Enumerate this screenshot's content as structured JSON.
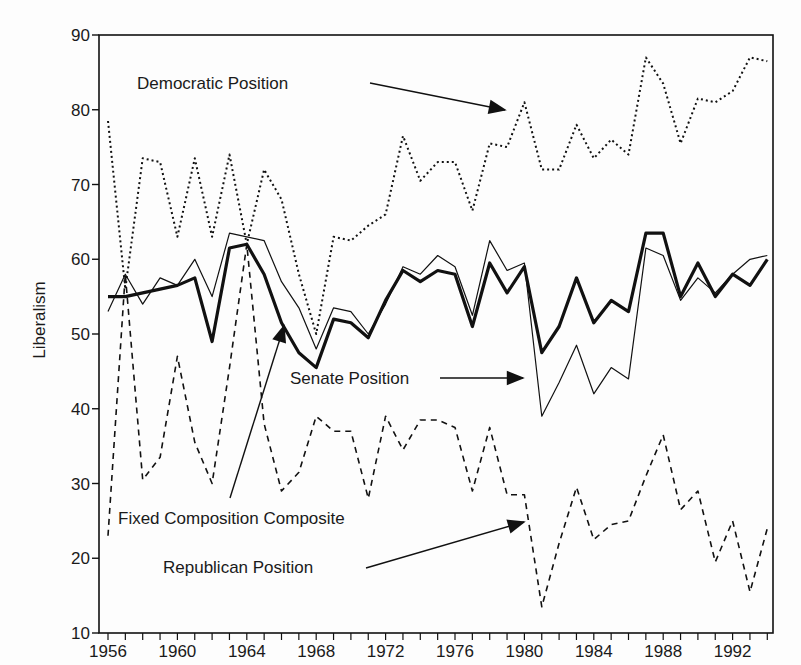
{
  "chart_data": {
    "type": "line",
    "title": "",
    "xlabel": "",
    "ylabel": "Liberalism",
    "xlim": [
      1956,
      1994
    ],
    "ylim": [
      10,
      90
    ],
    "yticks": [
      10,
      20,
      30,
      40,
      50,
      60,
      70,
      80,
      90
    ],
    "xtick_labels": [
      "1956",
      "1960",
      "1964",
      "1968",
      "1972",
      "1976",
      "1980",
      "1984",
      "1988",
      "1992"
    ],
    "grid": false,
    "x": [
      1956,
      1957,
      1958,
      1959,
      1960,
      1961,
      1962,
      1963,
      1964,
      1965,
      1966,
      1967,
      1968,
      1969,
      1970,
      1971,
      1972,
      1973,
      1974,
      1975,
      1976,
      1977,
      1978,
      1979,
      1980,
      1981,
      1982,
      1983,
      1984,
      1985,
      1986,
      1987,
      1988,
      1989,
      1990,
      1991,
      1992,
      1993,
      1994
    ],
    "series": [
      {
        "name": "Democratic Position",
        "style": "dotted",
        "values": [
          78.5,
          56,
          73.5,
          73,
          63,
          73.5,
          63,
          74,
          62,
          72,
          68,
          58,
          50,
          63,
          62.5,
          64.5,
          66,
          76.5,
          70.5,
          73,
          73,
          66.5,
          75.5,
          75,
          81,
          72,
          72,
          78,
          73.5,
          76,
          74,
          87,
          83.5,
          75.5,
          81.5,
          81,
          82.5,
          87,
          86.5
        ]
      },
      {
        "name": "Senate Position",
        "style": "thin-solid",
        "values": [
          53,
          58,
          54,
          57.5,
          56.5,
          60,
          55,
          63.5,
          63,
          62.5,
          57,
          53.5,
          48,
          53.5,
          53,
          50,
          54,
          59,
          58,
          60.5,
          59,
          52.5,
          62.5,
          58.5,
          59.5,
          39,
          43.5,
          48.5,
          42,
          45.5,
          44,
          61.5,
          60.5,
          54.5,
          57.5,
          55.5,
          58,
          60,
          60.5
        ]
      },
      {
        "name": "Fixed Composition Composite",
        "style": "thick-solid",
        "values": [
          55,
          55,
          55.5,
          56,
          56.5,
          57.5,
          49,
          61.5,
          62,
          58,
          51.5,
          47.5,
          45.5,
          52,
          51.5,
          49.5,
          54.5,
          58.5,
          57,
          58.5,
          58,
          51,
          59.5,
          55.5,
          59,
          47.5,
          51,
          57.5,
          51.5,
          54.5,
          53,
          63.5,
          63.5,
          55,
          59.5,
          55,
          58,
          56.5,
          60
        ]
      },
      {
        "name": "Republican Position",
        "style": "dashed",
        "values": [
          23,
          58,
          30.5,
          33.5,
          47,
          35.5,
          30,
          45.5,
          62,
          38,
          29,
          31.5,
          39,
          37,
          37,
          28,
          39,
          34.5,
          38.5,
          38.5,
          37.5,
          29,
          37.5,
          28.5,
          28.5,
          13.5,
          22,
          29.5,
          22.5,
          24.5,
          25,
          31,
          36.5,
          26.5,
          29,
          19.5,
          25,
          15.5,
          24
        ]
      }
    ],
    "annotations": [
      {
        "text": "Democratic Position",
        "label_x": 137,
        "label_y": 89,
        "arrow_from": [
          370,
          83
        ],
        "arrow_to": [
          505,
          110
        ]
      },
      {
        "text": "Senate Position",
        "label_x": 290,
        "label_y": 384,
        "arrow_from": [
          440,
          378
        ],
        "arrow_to": [
          523,
          378
        ]
      },
      {
        "text": "Fixed Composition Composite",
        "label_x": 118,
        "label_y": 524,
        "arrow_from": [
          230,
          498
        ],
        "arrow_to": [
          284,
          326
        ]
      },
      {
        "text": "Republican Position",
        "label_x": 163,
        "label_y": 573,
        "arrow_from": [
          366,
          568
        ],
        "arrow_to": [
          524,
          522
        ]
      }
    ]
  },
  "colors": {
    "line": "#111111",
    "background": "#fdfdfd"
  }
}
